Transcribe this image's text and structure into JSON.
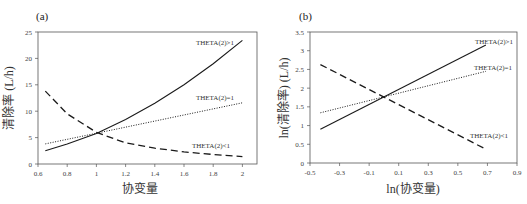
{
  "chart_data": [
    {
      "panel_label": "(a)",
      "type": "line",
      "title": "",
      "xlabel": "协变量",
      "ylabel": "清除率 (L/h)",
      "xlim": [
        0.6,
        2.1
      ],
      "ylim": [
        0,
        25
      ],
      "xticks": [
        "0.6",
        "0.8",
        "1",
        "1.2",
        "1.4",
        "1.6",
        "1.8",
        "2"
      ],
      "yticks": [
        "0",
        "5",
        "10",
        "15",
        "20",
        "25"
      ],
      "grid": false,
      "legend": "inline annotations",
      "series": [
        {
          "name": "THETA(2)>1",
          "style": "solid",
          "x": [
            0.65,
            0.8,
            1.0,
            1.2,
            1.4,
            1.6,
            1.8,
            2.0
          ],
          "y": [
            2.5,
            3.8,
            5.8,
            8.4,
            11.5,
            15.0,
            19.0,
            23.4
          ]
        },
        {
          "name": "THETA(2)=1",
          "style": "dotted",
          "x": [
            0.65,
            2.0
          ],
          "y": [
            3.8,
            11.6
          ]
        },
        {
          "name": "THETA(2)<1",
          "style": "dashed",
          "x": [
            0.65,
            0.8,
            1.0,
            1.2,
            1.4,
            1.6,
            1.8,
            2.0
          ],
          "y": [
            13.8,
            9.5,
            6.0,
            4.0,
            3.0,
            2.3,
            1.8,
            1.4
          ]
        }
      ]
    },
    {
      "panel_label": "(b)",
      "type": "line",
      "title": "",
      "xlabel": "ln(协变量)",
      "ylabel": "ln(清除率) (L/h)",
      "xlim": [
        -0.5,
        0.9
      ],
      "ylim": [
        0,
        3.5
      ],
      "xticks": [
        "-0.5",
        "-0.3",
        "-0.1",
        "0.1",
        "0.3",
        "0.5",
        "0.7",
        "0.9"
      ],
      "yticks": [
        "0",
        "0.5",
        "1",
        "1.5",
        "2",
        "2.5",
        "3",
        "3.5"
      ],
      "grid": false,
      "legend": "inline annotations",
      "series": [
        {
          "name": "THETA(2)>1",
          "style": "solid",
          "x": [
            -0.43,
            0.69
          ],
          "y": [
            0.9,
            3.15
          ]
        },
        {
          "name": "THETA(2)=1",
          "style": "dotted",
          "x": [
            -0.43,
            0.69
          ],
          "y": [
            1.34,
            2.45
          ]
        },
        {
          "name": "THETA(2)<1",
          "style": "dashed",
          "x": [
            -0.43,
            0.69
          ],
          "y": [
            2.63,
            0.37
          ]
        }
      ]
    }
  ]
}
